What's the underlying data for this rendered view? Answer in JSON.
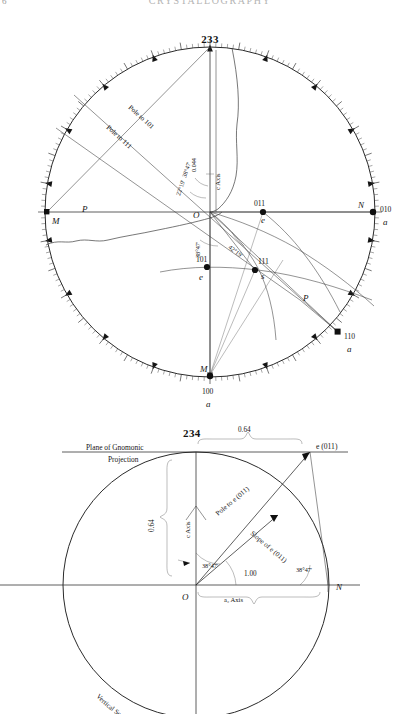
{
  "page": {
    "folio": "6",
    "running_head": "CRYSTALLOGRAPHY"
  },
  "figures": [
    {
      "number": "233",
      "title": "233",
      "caption": "Stereographic projection with graduated circle",
      "center_label": "O",
      "axis_label": "c Axis",
      "pole_labels": [
        {
          "text": "Pole to 101"
        },
        {
          "text": "Pole to 111"
        }
      ],
      "angles": [
        {
          "text": "38°47'"
        },
        {
          "text": "22°19'"
        },
        {
          "text": "38°47'"
        },
        {
          "text": "42°19'"
        }
      ],
      "distance_label": "0.044",
      "points": [
        {
          "index": "011",
          "letter": "e"
        },
        {
          "index": "111",
          "letter": "s"
        },
        {
          "index": "101",
          "letter": "e"
        },
        {
          "index": "110",
          "letter": "m"
        },
        {
          "index": "010",
          "letter": "a"
        },
        {
          "index": "100",
          "letter": "a"
        }
      ],
      "cardinal": [
        {
          "text": "M"
        },
        {
          "text": "N"
        },
        {
          "text": "M"
        }
      ],
      "plane_marks": [
        {
          "text": "P"
        },
        {
          "text": "P"
        }
      ]
    },
    {
      "number": "234",
      "title": "234",
      "caption": "Vertical section through spherical projection",
      "plane_label_line1": "Plane of Gnomonic",
      "plane_label_line2": "Projection",
      "top_point_label": "e (011)",
      "top_distance": "0.64",
      "vertical_distance": "0.64",
      "axis_c": "c Axis",
      "axis_a2": "a₂ Axis",
      "origin_label": "O",
      "right_label": "N",
      "horizontal_distance": "1.00",
      "angle_inner": "38°47'",
      "angle_outer": "38°47'",
      "pole_label": "Pole to e (011)",
      "slope_label": "Slope of e (011)",
      "arc_label": "Vertical Section through Spherical Projection"
    }
  ]
}
